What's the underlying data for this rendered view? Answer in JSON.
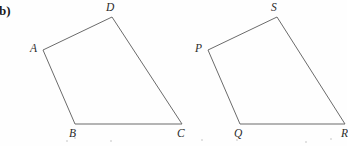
{
  "figure": {
    "part_label": "b)",
    "background_color": "#fefefe",
    "stroke_color": "#6b6b6b",
    "label_color": "#2b2b2b",
    "width": 347,
    "height": 146,
    "shapes": [
      {
        "name": "quadrilateral-abcd",
        "vertices": [
          {
            "id": "A",
            "label": "A",
            "x": 43,
            "y": 50,
            "label_x": 30,
            "label_y": 43
          },
          {
            "id": "D",
            "label": "D",
            "x": 112,
            "y": 17,
            "label_x": 106,
            "label_y": 2
          },
          {
            "id": "C",
            "label": "C",
            "x": 182,
            "y": 124,
            "label_x": 177,
            "label_y": 128
          },
          {
            "id": "B",
            "label": "B",
            "x": 75,
            "y": 124,
            "label_x": 69,
            "label_y": 128
          }
        ],
        "path": "M 43 50 L 112 17 L 182 124 L 75 124 Z"
      },
      {
        "name": "quadrilateral-pqrs",
        "vertices": [
          {
            "id": "P",
            "label": "P",
            "x": 208,
            "y": 50,
            "label_x": 195,
            "label_y": 43
          },
          {
            "id": "S",
            "label": "S",
            "x": 277,
            "y": 17,
            "label_x": 271,
            "label_y": 2
          },
          {
            "id": "R",
            "label": "R",
            "x": 345,
            "y": 124,
            "label_x": 341,
            "label_y": 128
          },
          {
            "id": "Q",
            "label": "Q",
            "x": 240,
            "y": 124,
            "label_x": 234,
            "label_y": 128
          }
        ],
        "path": "M 208 50 L 277 17 L 345 124 L 240 124 Z"
      }
    ],
    "scan_specks": [
      {
        "x": 66,
        "y": 140,
        "size": 2
      },
      {
        "x": 110,
        "y": 140,
        "size": 2
      },
      {
        "x": 74,
        "y": 137,
        "size": 2
      },
      {
        "x": 201,
        "y": 139,
        "size": 2
      },
      {
        "x": 236,
        "y": 139,
        "size": 2
      },
      {
        "x": 305,
        "y": 141,
        "size": 2
      },
      {
        "x": 330,
        "y": 138,
        "size": 2
      }
    ]
  }
}
